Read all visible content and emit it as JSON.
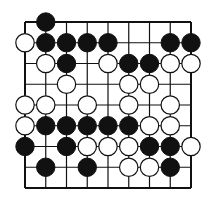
{
  "board": {
    "size": 9,
    "origin_x": 25,
    "origin_y": 22,
    "spacing": 20.75,
    "stone_radius": 9.2,
    "colors": {
      "background": "#ffffff",
      "line": "#111111",
      "black_stone": "#111111",
      "white_stone": "#ffffff",
      "white_outline": "#111111"
    },
    "stones": [
      {
        "color": "black",
        "col": 1,
        "row": 0
      },
      {
        "color": "white",
        "col": 0,
        "row": 1
      },
      {
        "color": "black",
        "col": 1,
        "row": 1
      },
      {
        "color": "black",
        "col": 2,
        "row": 1
      },
      {
        "color": "black",
        "col": 3,
        "row": 1
      },
      {
        "color": "black",
        "col": 4,
        "row": 1
      },
      {
        "color": "black",
        "col": 7,
        "row": 1
      },
      {
        "color": "black",
        "col": 8,
        "row": 1
      },
      {
        "color": "white",
        "col": 1,
        "row": 2
      },
      {
        "color": "black",
        "col": 2,
        "row": 2
      },
      {
        "color": "white",
        "col": 4,
        "row": 2
      },
      {
        "color": "black",
        "col": 5,
        "row": 2
      },
      {
        "color": "black",
        "col": 6,
        "row": 2
      },
      {
        "color": "white",
        "col": 7,
        "row": 2
      },
      {
        "color": "white",
        "col": 8,
        "row": 2
      },
      {
        "color": "white",
        "col": 2,
        "row": 3
      },
      {
        "color": "white",
        "col": 5,
        "row": 3
      },
      {
        "color": "white",
        "col": 6,
        "row": 3
      },
      {
        "color": "white",
        "col": 0,
        "row": 4
      },
      {
        "color": "white",
        "col": 1,
        "row": 4
      },
      {
        "color": "white",
        "col": 3,
        "row": 4
      },
      {
        "color": "white",
        "col": 5,
        "row": 4
      },
      {
        "color": "white",
        "col": 7,
        "row": 4
      },
      {
        "color": "white",
        "col": 0,
        "row": 5
      },
      {
        "color": "black",
        "col": 1,
        "row": 5
      },
      {
        "color": "black",
        "col": 2,
        "row": 5
      },
      {
        "color": "black",
        "col": 3,
        "row": 5
      },
      {
        "color": "black",
        "col": 4,
        "row": 5
      },
      {
        "color": "black",
        "col": 5,
        "row": 5
      },
      {
        "color": "white",
        "col": 6,
        "row": 5
      },
      {
        "color": "white",
        "col": 7,
        "row": 5
      },
      {
        "color": "black",
        "col": 0,
        "row": 6
      },
      {
        "color": "black",
        "col": 2,
        "row": 6
      },
      {
        "color": "white",
        "col": 3,
        "row": 6
      },
      {
        "color": "white",
        "col": 4,
        "row": 6
      },
      {
        "color": "white",
        "col": 5,
        "row": 6
      },
      {
        "color": "black",
        "col": 6,
        "row": 6
      },
      {
        "color": "black",
        "col": 7,
        "row": 6
      },
      {
        "color": "white",
        "col": 8,
        "row": 6
      },
      {
        "color": "black",
        "col": 1,
        "row": 7
      },
      {
        "color": "black",
        "col": 3,
        "row": 7
      },
      {
        "color": "white",
        "col": 5,
        "row": 7
      },
      {
        "color": "white",
        "col": 6,
        "row": 7
      },
      {
        "color": "black",
        "col": 7,
        "row": 7
      }
    ]
  }
}
